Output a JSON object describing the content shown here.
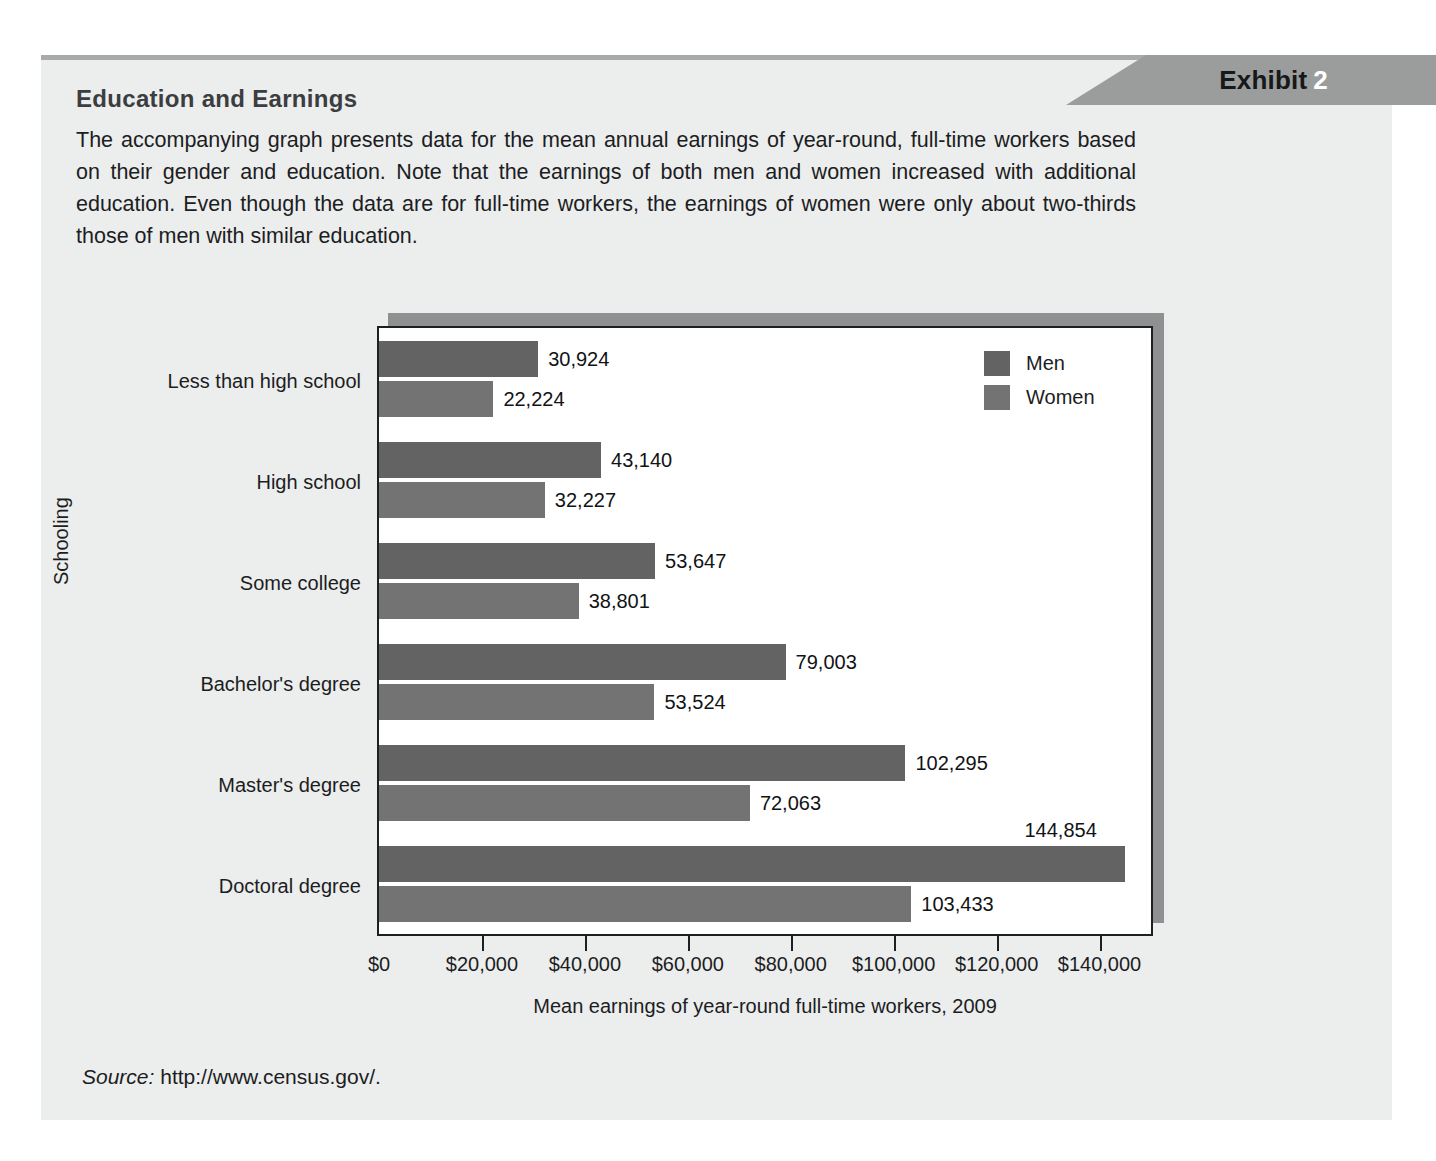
{
  "exhibit": {
    "banner_label": "Exhibit",
    "banner_number": "2",
    "title": "Education and Earnings",
    "body": "The accompanying graph presents data for the mean annual earnings of year-round, full-time workers based on their gender and education. Note that the earnings of both men and women increased with additional education. Even though the data are for full-time workers, the earnings of women were only about two-thirds those of men with similar education.",
    "source_word": "Source:",
    "source_url": "http://www.census.gov/."
  },
  "colors": {
    "men": "#636363",
    "women": "#737373",
    "panel_bg": "#eceded",
    "banner_bg": "#9b9d9d",
    "plot_bg": "#ffffff",
    "shadow": "#8e9091",
    "axis": "#1d1f21"
  },
  "chart_data": {
    "type": "bar",
    "orientation": "horizontal",
    "title": "",
    "xlabel": "Mean earnings of year-round full-time workers, 2009",
    "ylabel": "Schooling",
    "categories": [
      "Less than high school",
      "High school",
      "Some college",
      "Bachelor's degree",
      "Master's degree",
      "Doctoral degree"
    ],
    "series": [
      {
        "name": "Men",
        "values": [
          30924,
          43140,
          53647,
          79003,
          102295,
          144854
        ],
        "labels": [
          "30,924",
          "43,140",
          "53,647",
          "79,003",
          "102,295",
          "144,854"
        ]
      },
      {
        "name": "Women",
        "values": [
          22224,
          32227,
          38801,
          53524,
          72063,
          103433
        ],
        "labels": [
          "22,224",
          "32,227",
          "38,801",
          "53,524",
          "72,063",
          "103,433"
        ]
      }
    ],
    "xlim": [
      0,
      150000
    ],
    "xticks": [
      0,
      20000,
      40000,
      60000,
      80000,
      100000,
      120000,
      140000
    ],
    "xtick_labels": [
      "$0",
      "$20,000",
      "$40,000",
      "$60,000",
      "$80,000",
      "$100,000",
      "$120,000",
      "$140,000"
    ],
    "grid": false,
    "legend_position": "top-right",
    "legend_entries": [
      "Men",
      "Women"
    ]
  }
}
